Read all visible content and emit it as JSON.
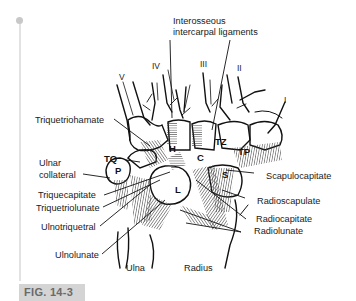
{
  "figure": {
    "label": "FIG. 14-3"
  },
  "metacarpal_rays": {
    "I": "I",
    "II": "II",
    "III": "III",
    "IV": "IV",
    "V": "V"
  },
  "bones": {
    "H": "H",
    "C": "C",
    "TZ": "TZ",
    "TP": "TP",
    "TQ": "TQ",
    "P": "P",
    "L": "L",
    "S": "S",
    "ulna": "Ulna",
    "radius": "Radius"
  },
  "ligaments": {
    "interosseous_line1": "Interosseous",
    "interosseous_line2": "intercarpal ligaments",
    "triquetriohamate": "Triquetriohamate",
    "ulnar_collateral_line1": "Ulnar",
    "ulnar_collateral_line2": "collateral",
    "triquecapitate": "Triquecapitate",
    "triquetriolunate": "Triquetriolunate",
    "ulnotriquetral": "Ulnotriquetral",
    "ulnolunate": "Ulnolunate",
    "scapulocapitate": "Scapulocapitate",
    "radioscapulate": "Radioscapulate",
    "radiocapitate": "Radiocapitate",
    "radiolunate": "Radiolunate"
  },
  "colors": {
    "ink": "#1a1a1a",
    "ligament_hatch": "#555555",
    "rail": "#e2e2e2",
    "fig_label_bg": "#d4d4d4",
    "fig_label_text": "#6a6a6a"
  }
}
